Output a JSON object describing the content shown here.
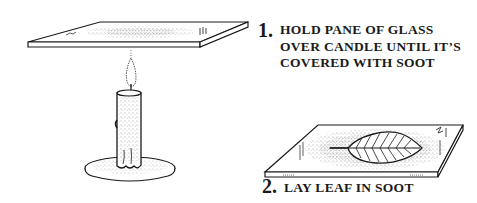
{
  "diagram": {
    "colors": {
      "ink": "#1a1a1a",
      "background": "#ffffff",
      "soot": "#444444"
    },
    "steps": [
      {
        "number": "1.",
        "lines": [
          "Hold pane of glass",
          "over candle until it’s",
          "covered with soot"
        ]
      },
      {
        "number": "2.",
        "lines": [
          "Lay leaf in soot"
        ]
      }
    ],
    "illustrations": [
      {
        "name": "glass-pane-over-candle",
        "elements": [
          "glass pane",
          "candle flame",
          "candle",
          "candle dish"
        ]
      },
      {
        "name": "sooted-pane-with-leaf",
        "elements": [
          "glass pane",
          "soot",
          "leaf"
        ]
      }
    ]
  }
}
